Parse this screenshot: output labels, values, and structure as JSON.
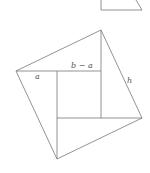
{
  "diagram": {
    "labels": {
      "a": "a",
      "b_minus_a": "b − a",
      "h": "h"
    },
    "colors": {
      "line": "#777777",
      "text": "#555555",
      "background": "#ffffff"
    }
  }
}
